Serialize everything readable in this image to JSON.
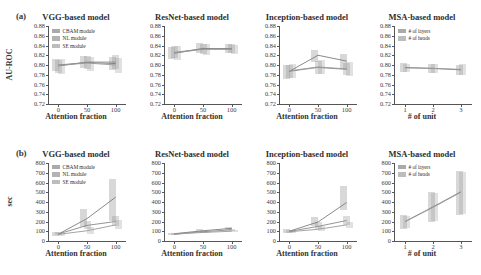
{
  "figure": {
    "panel_a_tag": "(a)",
    "panel_b_tag": "(b)"
  },
  "chart_data": [
    {
      "type": "line",
      "panel": "(a)",
      "title": "VGG-based model",
      "xlabel": "Attention fraction",
      "ylabel": "AU-ROC",
      "x": [
        0,
        50,
        100
      ],
      "xticks": [
        "0",
        "50",
        "100"
      ],
      "yticks": [
        "0.88",
        "0.86",
        "0.84",
        "0.82",
        "0.80",
        "0.78",
        "0.76",
        "0.74",
        "0.72"
      ],
      "ylim": [
        0.72,
        0.88
      ],
      "xlim": [
        -18,
        118
      ],
      "grid": false,
      "legend_position": "upper-left",
      "series": [
        {
          "name": "CBAM module",
          "color": "#7d7d7d",
          "values": [
            0.8,
            0.805,
            0.803
          ],
          "band_low": [
            0.787,
            0.793,
            0.79
          ],
          "band_high": [
            0.812,
            0.818,
            0.817
          ]
        },
        {
          "name": "NL module",
          "color": "#8a8a8a",
          "values": [
            0.798,
            0.806,
            0.806
          ],
          "band_low": [
            0.783,
            0.792,
            0.792
          ],
          "band_high": [
            0.811,
            0.819,
            0.82
          ]
        },
        {
          "name": "SE module",
          "color": "#9a9a9a",
          "values": [
            0.799,
            0.804,
            0.8
          ],
          "band_low": [
            0.781,
            0.788,
            0.784
          ],
          "band_high": [
            0.813,
            0.816,
            0.814
          ]
        }
      ]
    },
    {
      "type": "line",
      "panel": "(a)",
      "title": "ResNet-based model",
      "xlabel": "Attention fraction",
      "ylabel": "AU-ROC",
      "x": [
        0,
        50,
        100
      ],
      "xticks": [
        "0",
        "50",
        "100"
      ],
      "yticks": [
        "0.88",
        "0.86",
        "0.84",
        "0.82",
        "0.80",
        "0.78",
        "0.76",
        "0.74",
        "0.72"
      ],
      "ylim": [
        0.72,
        0.88
      ],
      "xlim": [
        -18,
        118
      ],
      "grid": false,
      "legend_position": "none",
      "series": [
        {
          "name": "CBAM module",
          "color": "#7d7d7d",
          "values": [
            0.824,
            0.834,
            0.833
          ],
          "band_low": [
            0.812,
            0.824,
            0.824
          ],
          "band_high": [
            0.836,
            0.845,
            0.843
          ]
        },
        {
          "name": "NL module",
          "color": "#8a8a8a",
          "values": [
            0.826,
            0.833,
            0.834
          ],
          "band_low": [
            0.815,
            0.823,
            0.825
          ],
          "band_high": [
            0.838,
            0.844,
            0.844
          ]
        },
        {
          "name": "SE module",
          "color": "#9a9a9a",
          "values": [
            0.825,
            0.832,
            0.832
          ],
          "band_low": [
            0.81,
            0.821,
            0.822
          ],
          "band_high": [
            0.839,
            0.843,
            0.842
          ]
        }
      ]
    },
    {
      "type": "line",
      "panel": "(a)",
      "title": "Inception-based model",
      "xlabel": "Attention fraction",
      "ylabel": "AU-ROC",
      "x": [
        0,
        50,
        100
      ],
      "xticks": [
        "0",
        "50",
        "100"
      ],
      "yticks": [
        "0.88",
        "0.86",
        "0.84",
        "0.82",
        "0.80",
        "0.78",
        "0.76",
        "0.74",
        "0.72"
      ],
      "ylim": [
        0.72,
        0.88
      ],
      "xlim": [
        -18,
        118
      ],
      "grid": false,
      "legend_position": "none",
      "series": [
        {
          "name": "CBAM module",
          "color": "#7d7d7d",
          "values": [
            0.787,
            0.82,
            0.808
          ],
          "band_low": [
            0.772,
            0.806,
            0.792
          ],
          "band_high": [
            0.801,
            0.831,
            0.822
          ]
        },
        {
          "name": "NL module",
          "color": "#8a8a8a",
          "values": [
            0.787,
            0.795,
            0.791
          ],
          "band_low": [
            0.774,
            0.782,
            0.779
          ],
          "band_high": [
            0.8,
            0.808,
            0.805
          ]
        },
        {
          "name": "SE module",
          "color": "#9a9a9a",
          "values": [
            0.788,
            0.796,
            0.792
          ],
          "band_low": [
            0.773,
            0.781,
            0.777
          ],
          "band_high": [
            0.802,
            0.81,
            0.807
          ]
        }
      ]
    },
    {
      "type": "line",
      "panel": "(a)",
      "title": "MSA-based model",
      "xlabel": "# of unit",
      "ylabel": "AU-ROC",
      "x": [
        1,
        2,
        3
      ],
      "xticks": [
        "1",
        "2",
        "3"
      ],
      "yticks": [
        "0.88",
        "0.86",
        "0.84",
        "0.82",
        "0.80",
        "0.78",
        "0.76",
        "0.74",
        "0.72"
      ],
      "ylim": [
        0.72,
        0.88
      ],
      "xlim": [
        0.6,
        3.4
      ],
      "grid": false,
      "legend_position": "upper-left",
      "series": [
        {
          "name": "# of layers",
          "color": "#7d7d7d",
          "values": [
            0.795,
            0.793,
            0.79
          ],
          "band_low": [
            0.786,
            0.784,
            0.779
          ],
          "band_high": [
            0.804,
            0.802,
            0.801
          ]
        },
        {
          "name": "# of heads",
          "color": "#9a9a9a",
          "values": [
            0.794,
            0.793,
            0.791
          ],
          "band_low": [
            0.785,
            0.783,
            0.78
          ],
          "band_high": [
            0.803,
            0.803,
            0.802
          ]
        }
      ]
    },
    {
      "type": "line",
      "panel": "(b)",
      "title": "VGG-based model",
      "xlabel": "Attention fraction",
      "ylabel": "sec",
      "x": [
        0,
        50,
        100
      ],
      "xticks": [
        "0",
        "50",
        "100"
      ],
      "yticks": [
        "800",
        "700",
        "600",
        "500",
        "400",
        "300",
        "200",
        "100",
        "0"
      ],
      "ylim": [
        0,
        800
      ],
      "xlim": [
        -18,
        118
      ],
      "grid": false,
      "legend_position": "upper-left",
      "series": [
        {
          "name": "CBAM module",
          "color": "#7d7d7d",
          "values": [
            70,
            230,
            450
          ],
          "band_low": [
            55,
            140,
            200
          ],
          "band_high": [
            90,
            330,
            640
          ]
        },
        {
          "name": "NL module",
          "color": "#8a8a8a",
          "values": [
            72,
            160,
            200
          ],
          "band_low": [
            58,
            120,
            150
          ],
          "band_high": [
            88,
            210,
            260
          ]
        },
        {
          "name": "SE module",
          "color": "#9a9a9a",
          "values": [
            68,
            105,
            165
          ],
          "band_low": [
            55,
            75,
            120
          ],
          "band_high": [
            82,
            140,
            215
          ]
        }
      ]
    },
    {
      "type": "line",
      "panel": "(b)",
      "title": "ResNet-based model",
      "xlabel": "Attention fraction",
      "ylabel": "sec",
      "x": [
        0,
        50,
        100
      ],
      "xticks": [
        "0",
        "50",
        "100"
      ],
      "yticks": [
        "800",
        "700",
        "600",
        "500",
        "400",
        "300",
        "200",
        "100",
        "0"
      ],
      "ylim": [
        0,
        800
      ],
      "xlim": [
        -18,
        118
      ],
      "grid": false,
      "legend_position": "none",
      "series": [
        {
          "name": "CBAM module",
          "color": "#7d7d7d",
          "values": [
            75,
            105,
            130
          ],
          "band_low": [
            66,
            95,
            115
          ],
          "band_high": [
            84,
            118,
            148
          ]
        },
        {
          "name": "NL module",
          "color": "#8a8a8a",
          "values": [
            72,
            95,
            115
          ],
          "band_low": [
            64,
            86,
            102
          ],
          "band_high": [
            80,
            105,
            128
          ]
        },
        {
          "name": "SE module",
          "color": "#9a9a9a",
          "values": [
            70,
            88,
            100
          ],
          "band_low": [
            62,
            80,
            90
          ],
          "band_high": [
            78,
            97,
            112
          ]
        }
      ]
    },
    {
      "type": "line",
      "panel": "(b)",
      "title": "Inception-based model",
      "xlabel": "Attention fraction",
      "ylabel": "sec",
      "x": [
        0,
        50,
        100
      ],
      "xticks": [
        "0",
        "50",
        "100"
      ],
      "yticks": [
        "800",
        "700",
        "600",
        "500",
        "400",
        "300",
        "200",
        "100",
        "0"
      ],
      "ylim": [
        0,
        800
      ],
      "xlim": [
        -18,
        118
      ],
      "grid": false,
      "legend_position": "none",
      "series": [
        {
          "name": "CBAM module",
          "color": "#7d7d7d",
          "values": [
            100,
            195,
            395
          ],
          "band_low": [
            85,
            150,
            320
          ],
          "band_high": [
            118,
            245,
            560
          ]
        },
        {
          "name": "NL module",
          "color": "#8a8a8a",
          "values": [
            98,
            150,
            210
          ],
          "band_low": [
            84,
            120,
            165
          ],
          "band_high": [
            114,
            190,
            255
          ]
        },
        {
          "name": "SE module",
          "color": "#9a9a9a",
          "values": [
            95,
            120,
            165
          ],
          "band_low": [
            82,
            98,
            130
          ],
          "band_high": [
            110,
            150,
            200
          ]
        }
      ]
    },
    {
      "type": "line",
      "panel": "(b)",
      "title": "MSA-based model",
      "xlabel": "# of unit",
      "ylabel": "sec",
      "x": [
        1,
        2,
        3
      ],
      "xticks": [
        "1",
        "2",
        "3"
      ],
      "yticks": [
        "800",
        "700",
        "600",
        "500",
        "400",
        "300",
        "200",
        "100",
        "0"
      ],
      "ylim": [
        0,
        800
      ],
      "xlim": [
        0.6,
        3.4
      ],
      "grid": false,
      "legend_position": "upper-left",
      "series": [
        {
          "name": "# of layers",
          "color": "#7d7d7d",
          "values": [
            200,
            350,
            505
          ],
          "band_low": [
            120,
            200,
            270
          ],
          "band_high": [
            265,
            500,
            720
          ]
        },
        {
          "name": "# of heads",
          "color": "#9a9a9a",
          "values": [
            198,
            345,
            500
          ],
          "band_low": [
            130,
            210,
            280
          ],
          "band_high": [
            255,
            490,
            710
          ]
        }
      ]
    }
  ]
}
